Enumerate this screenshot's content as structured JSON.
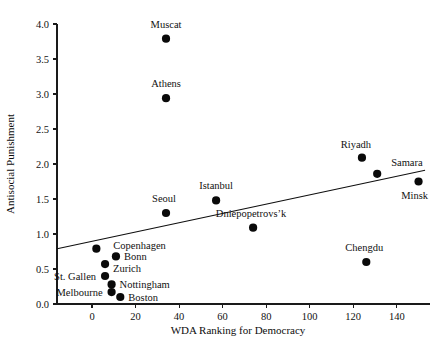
{
  "chart_data": {
    "type": "scatter",
    "title": "",
    "xlabel": "WDA Ranking for Democracy",
    "ylabel": "Antisocial Punishment",
    "xlim": [
      -16,
      155
    ],
    "ylim": [
      0.0,
      4.0
    ],
    "grid": false,
    "legend": "none",
    "xticks": [
      0,
      20,
      40,
      60,
      80,
      100,
      120,
      140
    ],
    "xtick_labels": [
      "0",
      "20",
      "40",
      "60",
      "80",
      "100",
      "120",
      "140"
    ],
    "yticks": [
      0.0,
      0.5,
      1.0,
      1.5,
      2.0,
      2.5,
      3.0,
      3.5,
      4.0
    ],
    "ytick_labels": [
      "0.0",
      "0.5",
      "1.0",
      "1.5",
      "2.0",
      "2.5",
      "3.0",
      "3.5",
      "4.0"
    ],
    "points": [
      {
        "label": "Muscat",
        "x": 34,
        "y": 3.79,
        "label_dx": 0,
        "label_dy": -11,
        "anchor": "middle"
      },
      {
        "label": "Athens",
        "x": 34,
        "y": 2.94,
        "label_dx": 0,
        "label_dy": -11,
        "anchor": "middle"
      },
      {
        "label": "Riyadh",
        "x": 124,
        "y": 2.09,
        "label_dx": -6,
        "label_dy": -10,
        "anchor": "middle"
      },
      {
        "label": "Samara",
        "x": 131,
        "y": 1.86,
        "label_dx": 14,
        "label_dy": -8,
        "anchor": "start"
      },
      {
        "label": "Minsk",
        "x": 150,
        "y": 1.75,
        "label_dx": -4,
        "label_dy": 17,
        "anchor": "middle"
      },
      {
        "label": "Istanbul",
        "x": 57,
        "y": 1.48,
        "label_dx": 0,
        "label_dy": -11,
        "anchor": "middle"
      },
      {
        "label": "Seoul",
        "x": 34,
        "y": 1.3,
        "label_dx": -2,
        "label_dy": -11,
        "anchor": "middle"
      },
      {
        "label": "Dniepopetrovs’k",
        "x": 74,
        "y": 1.09,
        "label_dx": -2,
        "label_dy": -11,
        "anchor": "middle"
      },
      {
        "label": "Copenhagen",
        "x": 2,
        "y": 0.79,
        "label_dx": 17,
        "label_dy": 0,
        "anchor": "start"
      },
      {
        "label": "Bonn",
        "x": 11,
        "y": 0.68,
        "label_dx": 8,
        "label_dy": 4,
        "anchor": "start"
      },
      {
        "label": "Zurich",
        "x": 6,
        "y": 0.57,
        "label_dx": 8,
        "label_dy": 8,
        "anchor": "start"
      },
      {
        "label": "St. Gallen",
        "x": 6,
        "y": 0.4,
        "label_dx": -9,
        "label_dy": 4,
        "anchor": "end"
      },
      {
        "label": "Nottingham",
        "x": 9,
        "y": 0.28,
        "label_dx": 8,
        "label_dy": 4,
        "anchor": "start"
      },
      {
        "label": "Melbourne",
        "x": 9,
        "y": 0.17,
        "label_dx": -9,
        "label_dy": 4,
        "anchor": "end"
      },
      {
        "label": "Boston",
        "x": 13,
        "y": 0.1,
        "label_dx": 8,
        "label_dy": 4,
        "anchor": "start"
      },
      {
        "label": "Chengdu",
        "x": 126,
        "y": 0.6,
        "label_dx": -2,
        "label_dy": -11,
        "anchor": "middle"
      }
    ],
    "trend_line": {
      "x_start": -16,
      "y_start": 0.79,
      "x_end": 153,
      "y_end": 1.91
    }
  }
}
